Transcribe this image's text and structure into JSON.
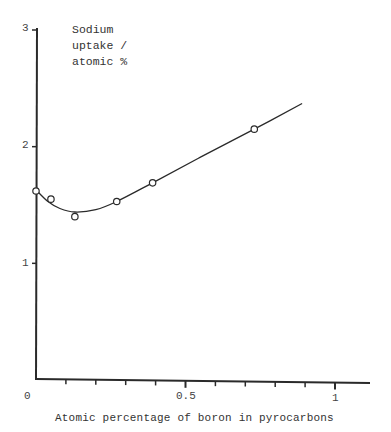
{
  "chart_data": {
    "type": "line",
    "title": "",
    "xlabel": "Atomic percentage of boron in pyrocarbons",
    "ylabel": "Sodium uptake / atomic %",
    "ylabel_lines": [
      "Sodium",
      "uptake /",
      "atomic %"
    ],
    "xlim": [
      0,
      1.12
    ],
    "ylim": [
      0,
      3
    ],
    "x_tick_labels": [
      "0",
      "0.5",
      "1"
    ],
    "x_minor_ticks": [
      0.1,
      0.2,
      0.3,
      0.4,
      0.5,
      0.6,
      0.7,
      0.8,
      0.9,
      1.0
    ],
    "y_tick_labels": [
      "1",
      "2",
      "3"
    ],
    "grid": false,
    "legend": null,
    "series": [
      {
        "name": "measured",
        "marker": "open-circle",
        "points": [
          {
            "x": 0.0,
            "y": 1.62
          },
          {
            "x": 0.05,
            "y": 1.55
          },
          {
            "x": 0.13,
            "y": 1.4
          },
          {
            "x": 0.27,
            "y": 1.53
          },
          {
            "x": 0.39,
            "y": 1.69
          },
          {
            "x": 0.73,
            "y": 2.15
          }
        ]
      },
      {
        "name": "fitted curve",
        "marker": "none",
        "points": [
          {
            "x": 0.0,
            "y": 1.63
          },
          {
            "x": 0.04,
            "y": 1.53
          },
          {
            "x": 0.08,
            "y": 1.47
          },
          {
            "x": 0.13,
            "y": 1.44
          },
          {
            "x": 0.2,
            "y": 1.46
          },
          {
            "x": 0.27,
            "y": 1.53
          },
          {
            "x": 0.39,
            "y": 1.69
          },
          {
            "x": 0.55,
            "y": 1.91
          },
          {
            "x": 0.73,
            "y": 2.15
          },
          {
            "x": 0.89,
            "y": 2.37
          }
        ]
      }
    ]
  }
}
